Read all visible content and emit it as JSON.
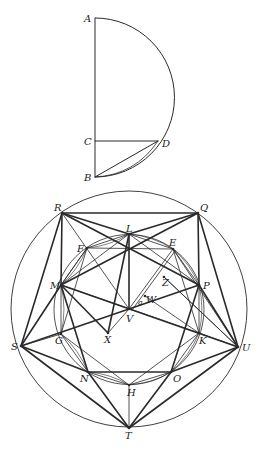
{
  "figure": {
    "stroke_color": "#2a2a2a",
    "background": "#ffffff"
  },
  "top_figure": {
    "points": {
      "A": [
        95,
        18
      ],
      "B": [
        95,
        177
      ],
      "C": [
        95,
        141
      ],
      "D": [
        158,
        141
      ]
    },
    "arc": {
      "center": [
        95,
        97.5
      ],
      "radius": 79.5
    },
    "labels": [
      {
        "text": "A",
        "x": 84,
        "y": 22
      },
      {
        "text": "C",
        "x": 84,
        "y": 145
      },
      {
        "text": "D",
        "x": 162,
        "y": 147
      },
      {
        "text": "B",
        "x": 84,
        "y": 181
      }
    ],
    "segments": [
      [
        "A",
        "B"
      ],
      [
        "C",
        "D"
      ],
      [
        "B",
        "D"
      ]
    ]
  },
  "bottom_figure": {
    "outer_circle": {
      "center": [
        129,
        309
      ],
      "radius": 118
    },
    "inner_circle": {
      "center": [
        129,
        309.5
      ],
      "radius": 75
    },
    "points": {
      "R": [
        62,
        213
      ],
      "Q": [
        198,
        213
      ],
      "L": [
        129,
        234
      ],
      "F": [
        87,
        248
      ],
      "E": [
        173,
        249
      ],
      "M": [
        61,
        285
      ],
      "P": [
        199,
        285
      ],
      "Z": [
        164,
        277
      ],
      "W": [
        145,
        296
      ],
      "V": [
        129,
        309
      ],
      "X": [
        108,
        333
      ],
      "S": [
        21,
        346
      ],
      "U": [
        238,
        347
      ],
      "G": [
        61,
        334
      ],
      "K": [
        199,
        333
      ],
      "N": [
        88,
        372
      ],
      "O": [
        171,
        372
      ],
      "H": [
        129,
        385
      ],
      "T": [
        129,
        428
      ]
    },
    "labels": [
      {
        "text": "R",
        "x": 54,
        "y": 211
      },
      {
        "text": "Q",
        "x": 200,
        "y": 211
      },
      {
        "text": "L",
        "x": 126,
        "y": 232
      },
      {
        "text": "E",
        "x": 169,
        "y": 246
      },
      {
        "text": "F",
        "x": 77,
        "y": 252
      },
      {
        "text": "Z",
        "x": 162,
        "y": 286
      },
      {
        "text": "M",
        "x": 50,
        "y": 289
      },
      {
        "text": "P",
        "x": 203,
        "y": 289
      },
      {
        "text": "W",
        "x": 146,
        "y": 303
      },
      {
        "text": "V",
        "x": 126,
        "y": 322
      },
      {
        "text": "X",
        "x": 104,
        "y": 343
      },
      {
        "text": "S",
        "x": 11,
        "y": 350
      },
      {
        "text": "G",
        "x": 55,
        "y": 344
      },
      {
        "text": "K",
        "x": 199,
        "y": 344
      },
      {
        "text": "U",
        "x": 242,
        "y": 351
      },
      {
        "text": "N",
        "x": 80,
        "y": 382
      },
      {
        "text": "O",
        "x": 173,
        "y": 382
      },
      {
        "text": "H",
        "x": 127,
        "y": 396
      },
      {
        "text": "T",
        "x": 125,
        "y": 439
      }
    ],
    "small_labels": [
      {
        "text": "a",
        "x": 138,
        "y": 305
      }
    ],
    "thick_segments": [
      [
        "R",
        "Q"
      ],
      [
        "R",
        "L"
      ],
      [
        "L",
        "Q"
      ],
      [
        "R",
        "M"
      ],
      [
        "Q",
        "P"
      ],
      [
        "R",
        "S"
      ],
      [
        "Q",
        "U"
      ],
      [
        "R",
        "P"
      ],
      [
        "Q",
        "M"
      ],
      [
        "M",
        "S"
      ],
      [
        "P",
        "U"
      ],
      [
        "M",
        "N"
      ],
      [
        "P",
        "O"
      ],
      [
        "S",
        "N"
      ],
      [
        "U",
        "O"
      ],
      [
        "S",
        "T"
      ],
      [
        "U",
        "T"
      ],
      [
        "N",
        "T"
      ],
      [
        "O",
        "T"
      ],
      [
        "N",
        "O"
      ],
      [
        "L",
        "X"
      ],
      [
        "M",
        "X"
      ],
      [
        "L",
        "V"
      ],
      [
        "M",
        "U"
      ],
      [
        "P",
        "S"
      ]
    ],
    "thin_segments": [
      [
        "F",
        "E"
      ],
      [
        "R",
        "V"
      ],
      [
        "V",
        "E"
      ],
      [
        "X",
        "V"
      ],
      [
        "M",
        "G"
      ],
      [
        "P",
        "K"
      ],
      [
        "S",
        "G"
      ],
      [
        "U",
        "K"
      ],
      [
        "G",
        "H"
      ],
      [
        "K",
        "H"
      ],
      [
        "H",
        "T"
      ],
      [
        "N",
        "H"
      ],
      [
        "O",
        "H"
      ],
      [
        "M",
        "K"
      ],
      [
        "Z",
        "U"
      ],
      [
        "E",
        "U"
      ],
      [
        "L",
        "P"
      ],
      [
        "L",
        "M"
      ],
      [
        "F",
        "M"
      ],
      [
        "E",
        "P"
      ],
      [
        "G",
        "N"
      ],
      [
        "K",
        "O"
      ],
      [
        "F",
        "G"
      ],
      [
        "E",
        "K"
      ],
      [
        "M",
        "F"
      ],
      [
        "L",
        "F"
      ],
      [
        "L",
        "E"
      ]
    ],
    "double_segment": [
      "V",
      "E"
    ]
  }
}
